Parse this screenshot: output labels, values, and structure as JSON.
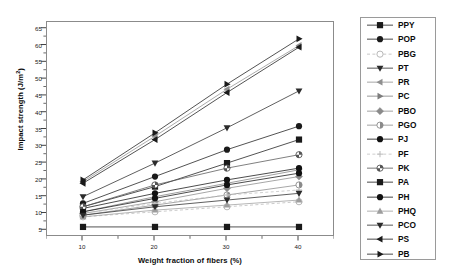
{
  "chart_data": {
    "type": "line",
    "title": "",
    "xlabel": "Weight fraction of fibers (%)",
    "ylabel": "Impact strength (J/m",
    "ylabel_sup": "2",
    "ylabel_tail": ")",
    "x": [
      10,
      20,
      30,
      40
    ],
    "xlim": [
      5,
      45
    ],
    "ylim": [
      3,
      67
    ],
    "xticks": [
      10,
      20,
      30,
      40
    ],
    "xtick_labels": [
      "10",
      "20",
      "30",
      "40"
    ],
    "yticks": [
      5,
      10,
      15,
      20,
      25,
      30,
      35,
      40,
      45,
      50,
      55,
      60,
      65
    ],
    "ytick_labels": [
      "5",
      "10",
      "15",
      "20",
      "25",
      "30",
      "35",
      "40",
      "45",
      "50",
      "55",
      "60",
      "65"
    ],
    "grid": false,
    "legend_position": "right",
    "series": [
      {
        "name": "PPY",
        "marker": "square",
        "color": "#1a1a1a",
        "values": [
          12.0,
          18.0,
          25.0,
          32.0
        ]
      },
      {
        "name": "POP",
        "marker": "circle",
        "color": "#1a1a1a",
        "values": [
          13.0,
          21.0,
          29.0,
          36.0
        ]
      },
      {
        "name": "PBG",
        "marker": "circle-open",
        "color": "#b9b9b9",
        "values": [
          9.0,
          10.5,
          12.0,
          13.5
        ]
      },
      {
        "name": "PT",
        "marker": "triangle-down",
        "color": "#2b2b2b",
        "values": [
          15.0,
          25.0,
          35.5,
          46.5
        ]
      },
      {
        "name": "PR",
        "marker": "triangle-left",
        "color": "#8f8f8f",
        "values": [
          19.5,
          33.0,
          47.0,
          60.0
        ]
      },
      {
        "name": "PC",
        "marker": "triangle-right",
        "color": "#7d7d7d",
        "values": [
          10.5,
          15.0,
          19.0,
          23.0
        ]
      },
      {
        "name": "PBO",
        "marker": "diamond",
        "color": "#8a8a8a",
        "values": [
          10.0,
          13.5,
          17.5,
          21.0
        ]
      },
      {
        "name": "PGO",
        "marker": "circle-half",
        "color": "#8a8a8a",
        "values": [
          9.5,
          12.5,
          15.5,
          18.5
        ]
      },
      {
        "name": "PJ",
        "marker": "circle",
        "color": "#111111",
        "values": [
          11.5,
          16.0,
          20.0,
          23.5
        ]
      },
      {
        "name": "PF",
        "marker": "plus-small",
        "color": "#c0c0c0",
        "values": [
          10.0,
          13.0,
          15.5,
          17.0
        ]
      },
      {
        "name": "PK",
        "marker": "circle-quarter",
        "color": "#555555",
        "values": [
          12.0,
          18.5,
          23.5,
          27.5
        ]
      },
      {
        "name": "PA",
        "marker": "square",
        "color": "#1a1a1a",
        "values": [
          6.0,
          6.0,
          6.0,
          6.0
        ]
      },
      {
        "name": "PH",
        "marker": "circle",
        "color": "#111111",
        "values": [
          10.5,
          14.5,
          18.5,
          22.0
        ]
      },
      {
        "name": "PHQ",
        "marker": "triangle-up",
        "color": "#9d9d9d",
        "values": [
          9.0,
          11.0,
          12.5,
          14.0
        ]
      },
      {
        "name": "PCO",
        "marker": "triangle-down",
        "color": "#2b2b2b",
        "values": [
          9.5,
          12.0,
          14.0,
          16.0
        ]
      },
      {
        "name": "PS",
        "marker": "triangle-left",
        "color": "#1a1a1a",
        "values": [
          19.0,
          32.0,
          46.0,
          59.5
        ]
      },
      {
        "name": "PB",
        "marker": "triangle-right",
        "color": "#1a1a1a",
        "values": [
          20.0,
          34.0,
          48.5,
          62.0
        ]
      }
    ]
  },
  "legend": {
    "items": [
      {
        "label": "PPY"
      },
      {
        "label": "POP"
      },
      {
        "label": "PBG"
      },
      {
        "label": "PT"
      },
      {
        "label": "PR"
      },
      {
        "label": "PC"
      },
      {
        "label": "PBO"
      },
      {
        "label": "PGO"
      },
      {
        "label": "PJ"
      },
      {
        "label": "PF"
      },
      {
        "label": "PK"
      },
      {
        "label": "PA"
      },
      {
        "label": "PH"
      },
      {
        "label": "PHQ"
      },
      {
        "label": "PCO"
      },
      {
        "label": "PS"
      },
      {
        "label": "PB"
      }
    ]
  }
}
